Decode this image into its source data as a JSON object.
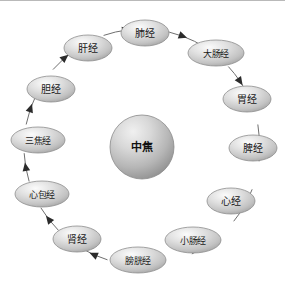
{
  "diagram": {
    "type": "cycle-diagram",
    "center": {
      "label": "中焦",
      "name": "center-node-zhongjiao"
    },
    "ring": {
      "radius": 118,
      "center_x": 142,
      "center_y": 146,
      "stroke_color": "#6f6f6f",
      "arrow_color": "#2b2b2b",
      "direction": "clockwise"
    },
    "node_style": {
      "fill_light": "#f2f2f2",
      "fill_mid": "#d4d4d4",
      "fill_dark": "#a9a9a9",
      "stroke_color": "#8e8e8e",
      "text_color": "#1a1a1a"
    },
    "nodes": [
      {
        "label": "肺经",
        "angle": -90,
        "cx": 145,
        "cy": 32,
        "rx": 24,
        "ry": 13,
        "name": "node-feijing"
      },
      {
        "label": "大肠经",
        "angle": -50,
        "cx": 216,
        "cy": 52,
        "rx": 28,
        "ry": 13,
        "name": "node-dachangjing"
      },
      {
        "label": "胃经",
        "angle": -18,
        "cx": 247,
        "cy": 98,
        "rx": 24,
        "ry": 13,
        "name": "node-weijing"
      },
      {
        "label": "脾经",
        "angle": 14,
        "cx": 253,
        "cy": 147,
        "rx": 24,
        "ry": 13,
        "name": "node-pijing"
      },
      {
        "label": "心经",
        "angle": 46,
        "cx": 231,
        "cy": 200,
        "rx": 24,
        "ry": 13,
        "name": "node-xinjing"
      },
      {
        "label": "小肠经",
        "angle": 72,
        "cx": 193,
        "cy": 239,
        "rx": 28,
        "ry": 13,
        "name": "node-xiaochangjing"
      },
      {
        "label": "膀胱经",
        "angle": 100,
        "cx": 138,
        "cy": 259,
        "rx": 28,
        "ry": 13,
        "name": "node-pangguangjing"
      },
      {
        "label": "肾经",
        "angle": 128,
        "cx": 77,
        "cy": 238,
        "rx": 24,
        "ry": 13,
        "name": "node-shenjing"
      },
      {
        "label": "心包经",
        "angle": 156,
        "cx": 42,
        "cy": 193,
        "rx": 27,
        "ry": 13,
        "name": "node-xinbaojing"
      },
      {
        "label": "三焦经",
        "angle": 184,
        "cx": 38,
        "cy": 139,
        "rx": 27,
        "ry": 13,
        "name": "node-sanjiaojing"
      },
      {
        "label": "胆经",
        "angle": 214,
        "cx": 51,
        "cy": 88,
        "rx": 24,
        "ry": 13,
        "name": "node-danjing"
      },
      {
        "label": "肝经",
        "angle": 244,
        "cx": 88,
        "cy": 47,
        "rx": 24,
        "ry": 13,
        "name": "node-ganjing"
      }
    ],
    "flow_order": [
      "肺经",
      "大肠经",
      "胃经",
      "脾经",
      "心经",
      "小肠经",
      "膀胱经",
      "肾经",
      "心包经",
      "三焦经",
      "胆经",
      "肝经"
    ],
    "arrows": [
      {
        "angle": -70,
        "name": "arrow-feijing-to-dachangjing"
      },
      {
        "angle": -34,
        "name": "arrow-dachangjing-to-weijing"
      },
      {
        "angle": -2,
        "name": "arrow-weijing-to-pijing"
      },
      {
        "angle": 30,
        "name": "arrow-pijing-to-xinjing"
      },
      {
        "angle": 60,
        "name": "arrow-xinjing-to-xiaochangjing"
      },
      {
        "angle": 86,
        "name": "arrow-xiaochangjing-to-pangguangjing"
      },
      {
        "angle": 114,
        "name": "arrow-pangguangjing-to-shenjing"
      },
      {
        "angle": 142,
        "name": "arrow-shenjing-to-xinbaojing"
      },
      {
        "angle": 170,
        "name": "arrow-xinbaojing-to-sanjiaojing"
      },
      {
        "angle": 199,
        "name": "arrow-sanjiaojing-to-danjing"
      },
      {
        "angle": 229,
        "name": "arrow-danjing-to-ganjing"
      },
      {
        "angle": 262,
        "name": "arrow-ganjing-to-feijing"
      }
    ]
  }
}
